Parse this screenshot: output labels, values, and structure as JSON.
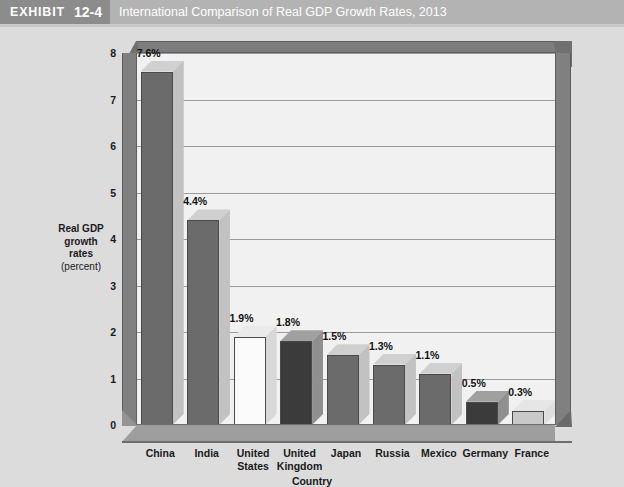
{
  "header": {
    "exhibit_word": "EXHIBIT",
    "exhibit_number": "12-4",
    "title": "International Comparison of Real GDP Growth Rates, 2013",
    "band_color": "#b3b3b3",
    "badge_color": "#8c8c8c",
    "text_color": "#ffffff"
  },
  "chart_data": {
    "type": "bar",
    "title": "International Comparison of Real GDP Growth Rates, 2013",
    "categories": [
      "China",
      "India",
      "United States",
      "United Kingdom",
      "Japan",
      "Russia",
      "Mexico",
      "Germany",
      "France"
    ],
    "category_lines": [
      [
        "China"
      ],
      [
        "India"
      ],
      [
        "United",
        "States"
      ],
      [
        "United",
        "Kingdom"
      ],
      [
        "Japan"
      ],
      [
        "Russia"
      ],
      [
        "Mexico"
      ],
      [
        "Germany"
      ],
      [
        "France"
      ]
    ],
    "values": [
      7.6,
      4.4,
      1.9,
      1.8,
      1.5,
      1.3,
      1.1,
      0.5,
      0.3
    ],
    "data_labels": [
      "7.6%",
      "4.4%",
      "1.9%",
      "1.8%",
      "1.5%",
      "1.3%",
      "1.1%",
      "0.5%",
      "0.3%"
    ],
    "bar_colors": [
      "#6b6b6b",
      "#6b6b6b",
      "#fbfbfb",
      "#3b3b3b",
      "#6b6b6b",
      "#6b6b6b",
      "#6b6b6b",
      "#3b3b3b",
      "#c9c9c9"
    ],
    "bar_side_colors": [
      "#c2c2c2",
      "#c2c2c2",
      "#d8d8d8",
      "#8f8f8f",
      "#c2c2c2",
      "#c2c2c2",
      "#c2c2c2",
      "#8f8f8f",
      "#dedede"
    ],
    "bar_top_colors": [
      "#d0d0d0",
      "#d0d0d0",
      "#eaeaea",
      "#a0a0a0",
      "#d0d0d0",
      "#d0d0d0",
      "#d0d0d0",
      "#a0a0a0",
      "#e6e6e6"
    ],
    "xlabel": "Country",
    "ylabel_lines": [
      "Real GDP",
      "growth",
      "rates"
    ],
    "ylabel_unit": "(percent)",
    "ylim": [
      0,
      8
    ],
    "yticks": [
      0,
      1,
      2,
      3,
      4,
      5,
      6,
      7,
      8
    ],
    "ytick_labels": [
      "0",
      "1",
      "2",
      "3",
      "4",
      "5",
      "6",
      "7",
      "8"
    ],
    "grid": true,
    "legend": "none",
    "plot_background": "#f1f1f1",
    "gridline_color": "#9a9a9a",
    "frame_color": "#808080"
  }
}
